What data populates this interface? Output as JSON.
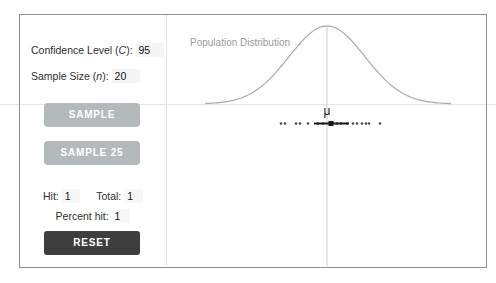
{
  "panel": {
    "confidence": {
      "pre": "Confidence Level (",
      "var": "C",
      "post": "): ",
      "value": "95"
    },
    "sample_size": {
      "pre": "Sample Size (",
      "var": "n",
      "post": "): ",
      "value": "20"
    },
    "buttons": {
      "sample": "SAMPLE",
      "sample25": "SAMPLE 25",
      "reset": "RESET"
    },
    "stats": {
      "hit_label": "Hit:",
      "hit_value": "1",
      "total_label": "Total:",
      "total_value": "1",
      "percent_label": "Percent hit:",
      "percent_value": "1"
    }
  },
  "plot": {
    "annotation": "Population Distribution →",
    "mu": "μ"
  },
  "chart_data": {
    "type": "area",
    "curve": {
      "shape": "normal",
      "center_x": 327,
      "sigma": 38,
      "baseline_y": 104,
      "amplitude": 78,
      "x_start": 205,
      "x_end": 452,
      "color": "#a9a9a9"
    },
    "center_line": {
      "x": 327,
      "y1": 27,
      "y2": 266,
      "color": "#cfcfcf"
    },
    "interval": {
      "x1": 314,
      "x2": 349,
      "y": 123.5,
      "color": "#1b1b1b",
      "thickness": 2,
      "marker_x": 331,
      "marker_size": 5
    },
    "dots": {
      "y": 123.5,
      "r": 1.3,
      "color": "#4a4a4a",
      "xs": [
        281,
        285,
        296,
        300,
        308,
        318,
        323,
        337,
        341,
        347,
        353,
        357,
        362,
        366,
        369,
        380
      ]
    }
  }
}
